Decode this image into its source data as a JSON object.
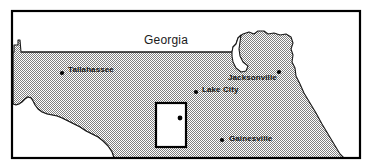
{
  "figure": {
    "name": "north-florida-study-area-map",
    "width": 372,
    "height": 168,
    "frame_color": "#000000",
    "land_fill_color": "#b4b4b4",
    "water_fill_color": "#ffffff",
    "coastline_color": "#000000"
  },
  "region_labels": [
    {
      "id": "georgia",
      "text": "Georgia"
    }
  ],
  "cities": [
    {
      "id": "tallahassee",
      "name": "Tallahassee",
      "dot_x": 62,
      "dot_y": 73,
      "label_x": 68,
      "label_y": 66
    },
    {
      "id": "jacksonville",
      "name": "Jacksonville",
      "dot_x": 279,
      "dot_y": 72,
      "label_x": 228,
      "label_y": 74
    },
    {
      "id": "lake-city",
      "name": "Lake City",
      "dot_x": 196,
      "dot_y": 92,
      "label_x": 202,
      "label_y": 86
    },
    {
      "id": "gainesville",
      "name": "Gainesville",
      "dot_x": 222,
      "dot_y": 140,
      "label_x": 229,
      "label_y": 135
    }
  ],
  "study_area": {
    "id": "study-area-inset",
    "x": 156,
    "y": 103,
    "width": 30,
    "height": 44,
    "border_color": "#000000",
    "fill_color": "#ffffff",
    "site_dot_x": 180,
    "site_dot_y": 118
  },
  "borders": {
    "georgia_state_line": "horizontal line along the northern edge from the panhandle east to the St. Marys notch"
  }
}
